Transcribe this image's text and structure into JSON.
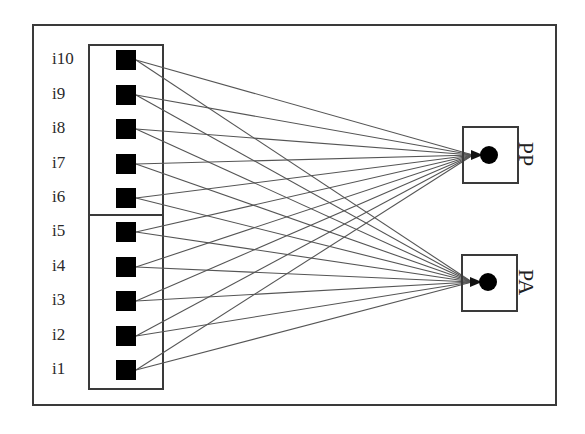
{
  "diagram": {
    "type": "bipartite-network",
    "inputs": [
      {
        "id": "i10",
        "label": "i10",
        "y": 60
      },
      {
        "id": "i9",
        "label": "i9",
        "y": 95
      },
      {
        "id": "i8",
        "label": "i8",
        "y": 129
      },
      {
        "id": "i7",
        "label": "i7",
        "y": 164
      },
      {
        "id": "i6",
        "label": "i6",
        "y": 198
      },
      {
        "id": "i5",
        "label": "i5",
        "y": 232
      },
      {
        "id": "i4",
        "label": "i4",
        "y": 267
      },
      {
        "id": "i3",
        "label": "i3",
        "y": 301
      },
      {
        "id": "i2",
        "label": "i2",
        "y": 336
      },
      {
        "id": "i1",
        "label": "i1",
        "y": 370
      }
    ],
    "input_groups": [
      {
        "members": [
          "i10",
          "i9",
          "i8",
          "i7",
          "i6"
        ]
      },
      {
        "members": [
          "i5",
          "i4",
          "i3",
          "i2",
          "i1"
        ]
      }
    ],
    "outputs": [
      {
        "id": "PP",
        "label": "PP",
        "x": 489,
        "y": 155
      },
      {
        "id": "PA",
        "label": "PA",
        "x": 488,
        "y": 282
      }
    ],
    "edges": "each input connects to both PP and PA",
    "colors": {
      "line": "#555555",
      "node": "#000000",
      "frame": "#3a3a3a"
    }
  }
}
